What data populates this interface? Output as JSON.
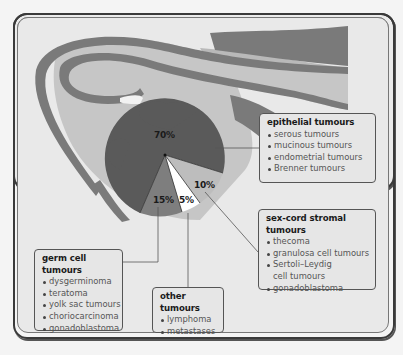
{
  "diagram": {
    "pie_segments": [
      {
        "id": "epithelial",
        "label": "70%",
        "value": 70,
        "color": "#5a5a5a"
      },
      {
        "id": "germ_cell",
        "label": "15%",
        "value": 15,
        "color": "#7e7e7e"
      },
      {
        "id": "other",
        "label": "5%",
        "value": 5,
        "color": "#ffffff"
      },
      {
        "id": "sex_cord_stromal",
        "label": "10%",
        "value": 10,
        "color": "#bdbdbd"
      }
    ],
    "boxes": {
      "epithelial": {
        "title": "epithelial tumours",
        "items": [
          "serous tumours",
          "mucinous tumours",
          "endometrial tumours",
          "Brenner tumours"
        ]
      },
      "sex_cord": {
        "title": "sex-cord stromal tumours",
        "items": [
          "thecoma",
          "granulosa cell tumours",
          "Sertoli–Leydig",
          "cell tumours",
          "gonadoblastoma"
        ]
      },
      "germ_cell": {
        "title": "germ cell tumours",
        "items": [
          "dysgerminoma",
          "teratoma",
          "yolk sac tumours",
          "choriocarcinoma",
          "gonadoblastoma"
        ]
      },
      "other": {
        "title": "other tumours",
        "items": [
          "lymphoma",
          "metastases"
        ]
      }
    },
    "colors": {
      "frame_border": "#3a3a3a",
      "background": "#e9e9e9",
      "tube_dark": "#7a7a7a",
      "tube_light": "#b9b9b9",
      "pie_dark": "#5a5a5a"
    }
  }
}
